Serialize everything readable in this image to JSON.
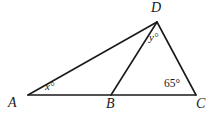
{
  "figure": {
    "type": "geometry-diagram",
    "width": 218,
    "height": 115,
    "background_color": "#ffffff",
    "stroke_color": "#1a1a1a"
  },
  "vertices": [
    {
      "id": "A",
      "label": "A",
      "x": 28,
      "y": 95
    },
    {
      "id": "B",
      "label": "B",
      "x": 111,
      "y": 95
    },
    {
      "id": "C",
      "label": "C",
      "x": 196,
      "y": 95
    },
    {
      "id": "D",
      "label": "D",
      "x": 157,
      "y": 22
    }
  ],
  "segments": [
    {
      "id": "AC",
      "from": "A",
      "to": "C",
      "x1": 28,
      "y1": 95,
      "x2": 196,
      "y2": 95
    },
    {
      "id": "AD",
      "from": "A",
      "to": "D",
      "x1": 28,
      "y1": 95,
      "x2": 157,
      "y2": 22
    },
    {
      "id": "BD",
      "from": "B",
      "to": "D",
      "x1": 111,
      "y1": 95,
      "x2": 157,
      "y2": 22
    },
    {
      "id": "DC",
      "from": "D",
      "to": "C",
      "x1": 157,
      "y1": 22,
      "x2": 196,
      "y2": 95
    }
  ],
  "angle_labels": [
    {
      "id": "x",
      "text": "x°",
      "at_vertex": "A",
      "x": 45,
      "y": 81
    },
    {
      "id": "y",
      "text": "y°",
      "at_vertex": "D",
      "x": 149,
      "y": 32
    },
    {
      "id": "c65",
      "text": "65°",
      "at_vertex": "C",
      "x": 164,
      "y": 78
    }
  ],
  "labels": {
    "A": "A",
    "B": "B",
    "C": "C",
    "D": "D",
    "angle_x": "x°",
    "angle_y": "y°",
    "angle_c": "65°"
  }
}
